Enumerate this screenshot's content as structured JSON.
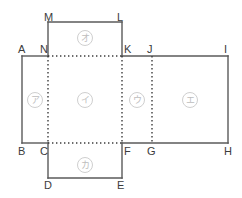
{
  "figure": {
    "kind": "box-net-diagram",
    "background_color": "#ffffff",
    "solid_line_color": "#5a5a5a",
    "dotted_line_color": "#3c3c3c",
    "label_color": "#3c3c3c",
    "face_label_color": "#bdbdbd"
  },
  "vertices": [
    {
      "name": "A",
      "label": "A",
      "x": 18,
      "y": 44
    },
    {
      "name": "N",
      "label": "N",
      "x": 40,
      "y": 44
    },
    {
      "name": "M",
      "label": "M",
      "x": 44,
      "y": 12
    },
    {
      "name": "L",
      "label": "L",
      "x": 117,
      "y": 12
    },
    {
      "name": "K",
      "label": "K",
      "x": 124,
      "y": 44
    },
    {
      "name": "J",
      "label": "J",
      "x": 147,
      "y": 44
    },
    {
      "name": "I",
      "label": "I",
      "x": 224,
      "y": 44
    },
    {
      "name": "B",
      "label": "B",
      "x": 18,
      "y": 146
    },
    {
      "name": "C",
      "label": "C",
      "x": 40,
      "y": 146
    },
    {
      "name": "F",
      "label": "F",
      "x": 124,
      "y": 146
    },
    {
      "name": "G",
      "label": "G",
      "x": 147,
      "y": 146
    },
    {
      "name": "H",
      "label": "H",
      "x": 224,
      "y": 146
    },
    {
      "name": "D",
      "label": "D",
      "x": 44,
      "y": 180
    },
    {
      "name": "E",
      "label": "E",
      "x": 117,
      "y": 180
    }
  ],
  "faces": [
    {
      "name": "face-a",
      "label": "ア",
      "x": 27,
      "y": 92
    },
    {
      "name": "face-i",
      "label": "イ",
      "x": 77,
      "y": 92
    },
    {
      "name": "face-u",
      "label": "ウ",
      "x": 129,
      "y": 92
    },
    {
      "name": "face-e",
      "label": "エ",
      "x": 182,
      "y": 92
    },
    {
      "name": "face-o",
      "label": "オ",
      "x": 77,
      "y": 30
    },
    {
      "name": "face-ka",
      "label": "カ",
      "x": 77,
      "y": 157
    }
  ],
  "geometry": {
    "band": {
      "left": 22,
      "right": 228,
      "top": 56,
      "bottom": 143
    },
    "top_flap": {
      "left": 48,
      "right": 122,
      "top": 22,
      "bottom": 56
    },
    "bottom_flap": {
      "left": 48,
      "right": 122,
      "top": 143,
      "bottom": 178
    },
    "fold_lines_vertical_x": [
      48,
      122,
      152
    ],
    "fold_lines_horizontal": [
      {
        "y": 56,
        "x1": 48,
        "x2": 122
      },
      {
        "y": 143,
        "x1": 48,
        "x2": 122
      }
    ]
  }
}
